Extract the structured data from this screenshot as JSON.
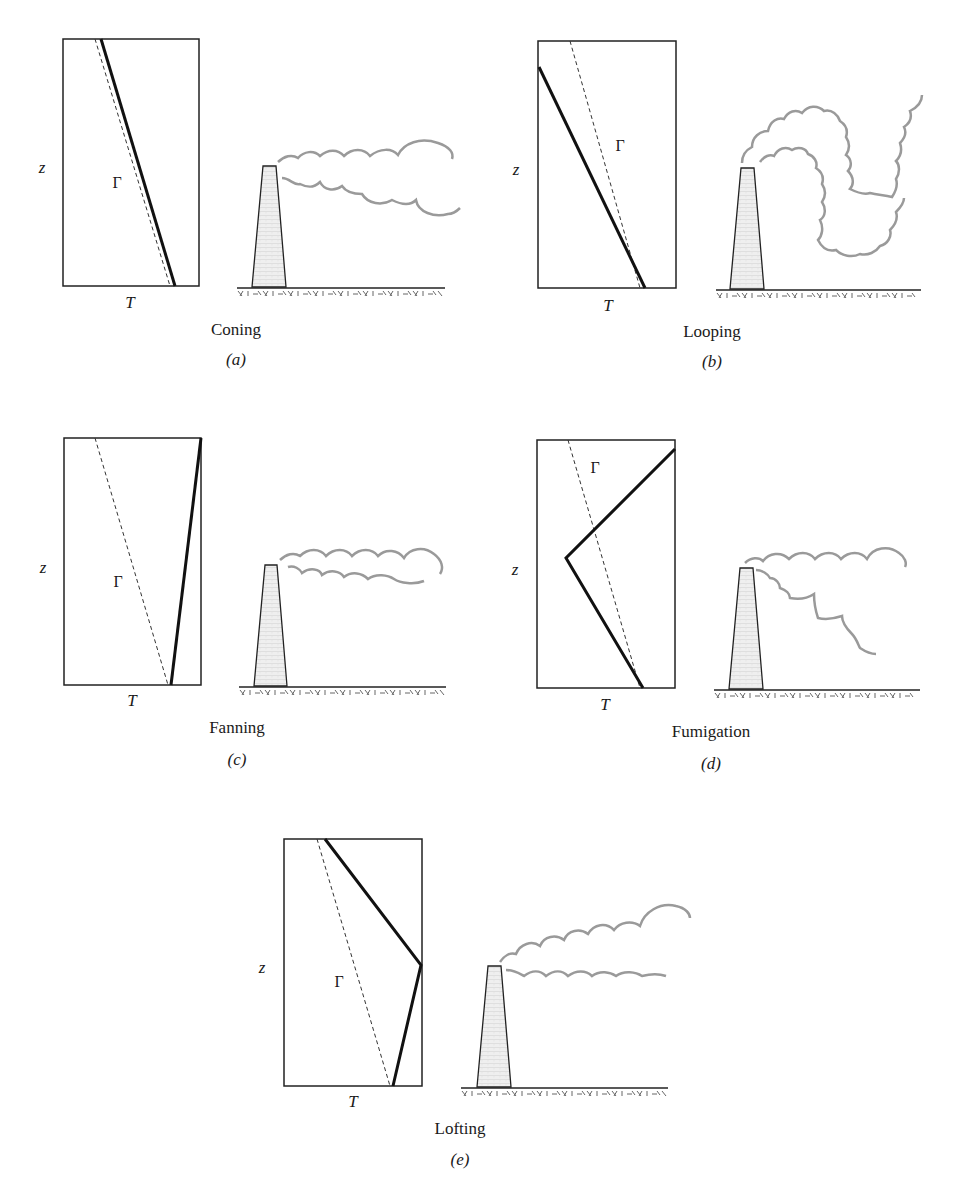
{
  "figure": {
    "axis_labels": {
      "y": "z",
      "x": "T"
    },
    "lapse_symbol": "Γ",
    "colors": {
      "line": "#111111",
      "plume": "#9a9a9a",
      "stack_fill": "#ececec",
      "ground_hatch": "#555555"
    },
    "panels": [
      {
        "id": "a",
        "name": "Coning",
        "tag": "(a)",
        "description": "Environmental lapse rate slightly less than adiabatic; plume spreads as a cone.",
        "profile": [
          [
            101,
            39
          ],
          [
            175,
            286
          ]
        ],
        "adiabatic": [
          [
            95,
            39
          ],
          [
            170,
            286
          ]
        ]
      },
      {
        "id": "b",
        "name": "Looping",
        "tag": "(b)",
        "description": "Superadiabatic (unstable) lapse rate; plume loops up and down.",
        "profile": [
          [
            539,
            67
          ],
          [
            645,
            288
          ]
        ],
        "adiabatic": [
          [
            570,
            41
          ],
          [
            640,
            288
          ]
        ]
      },
      {
        "id": "c",
        "name": "Fanning",
        "tag": "(c)",
        "description": "Inversion (stable); plume fans out horizontally.",
        "profile": [
          [
            171,
            685
          ],
          [
            201,
            438
          ]
        ],
        "adiabatic": [
          [
            95,
            438
          ],
          [
            168,
            685
          ]
        ]
      },
      {
        "id": "d",
        "name": "Fumigation",
        "tag": "(d)",
        "description": "Inversion aloft, unstable below; plume mixed down to ground.",
        "profile": [
          [
            643,
            688
          ],
          [
            566,
            558
          ],
          [
            675,
            449
          ]
        ],
        "adiabatic": [
          [
            568,
            440
          ],
          [
            640,
            688
          ]
        ]
      },
      {
        "id": "e",
        "name": "Lofting",
        "tag": "(e)",
        "description": "Unstable aloft, inversion below; plume lofts upward.",
        "profile": [
          [
            393,
            1086
          ],
          [
            421,
            965
          ],
          [
            325,
            839
          ]
        ],
        "adiabatic": [
          [
            317,
            839
          ],
          [
            390,
            1086
          ]
        ]
      }
    ]
  }
}
